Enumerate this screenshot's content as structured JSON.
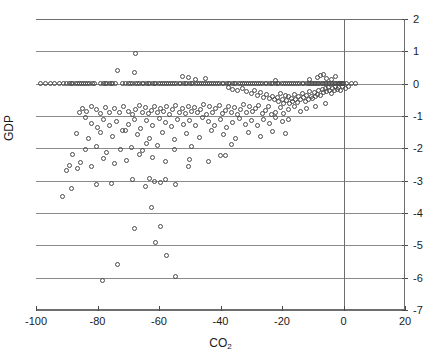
{
  "chart_data": {
    "type": "scatter",
    "title": "",
    "xlabel": "CO2",
    "xlabel_display": "CO",
    "xlabel_sub": "2",
    "ylabel": "GDP",
    "xlim": [
      -100,
      20
    ],
    "ylim": [
      -7,
      2
    ],
    "xticks": [
      -100,
      -80,
      -60,
      -40,
      -20,
      0,
      20
    ],
    "xtick_labels": [
      "-100",
      "-80",
      "-60",
      "-40",
      "-20",
      "0",
      "20"
    ],
    "yticks": [
      2,
      1,
      0,
      -1,
      -2,
      -3,
      -4,
      -5,
      -6,
      -7
    ],
    "ytick_labels": [
      "2",
      "1",
      "0",
      "-1",
      "-2",
      "-3",
      "-4",
      "-5",
      "-6",
      "-7"
    ],
    "ytick_side": "right",
    "grid": "horizontal",
    "grid_color": "#8a8a8a",
    "marker": "open-circle",
    "marker_color": "#4a4a4a",
    "reference_line_x": 0,
    "n_points": 420,
    "points": [
      [
        -98.5,
        0.0
      ],
      [
        -96.8,
        0.0
      ],
      [
        -95.2,
        0.0
      ],
      [
        -94.0,
        0.0
      ],
      [
        -92.5,
        0.0
      ],
      [
        -91.0,
        0.0
      ],
      [
        -90.0,
        0.0
      ],
      [
        -89.2,
        0.0
      ],
      [
        -88.5,
        0.0
      ],
      [
        -88.0,
        0.0
      ],
      [
        -87.3,
        0.0
      ],
      [
        -86.5,
        0.0
      ],
      [
        -86.0,
        0.0
      ],
      [
        -85.2,
        0.0
      ],
      [
        -84.5,
        0.0
      ],
      [
        -84.0,
        0.0
      ],
      [
        -83.2,
        0.0
      ],
      [
        -82.5,
        0.0
      ],
      [
        -81.8,
        0.0
      ],
      [
        -81.0,
        0.0
      ],
      [
        -79.0,
        0.0
      ],
      [
        -78.2,
        0.0
      ],
      [
        -77.5,
        0.0
      ],
      [
        -77.0,
        0.0
      ],
      [
        -76.2,
        0.0
      ],
      [
        -75.5,
        0.0
      ],
      [
        -75.0,
        0.0
      ],
      [
        -74.2,
        0.0
      ],
      [
        -72.0,
        0.0
      ],
      [
        -71.0,
        0.0
      ],
      [
        -70.0,
        0.0
      ],
      [
        -69.2,
        0.0
      ],
      [
        -68.5,
        0.0
      ],
      [
        -67.8,
        0.0
      ],
      [
        -67.0,
        0.0
      ],
      [
        -66.2,
        0.0
      ],
      [
        -65.5,
        0.0
      ],
      [
        -65.0,
        0.0
      ],
      [
        -64.2,
        0.0
      ],
      [
        -63.5,
        0.0
      ],
      [
        -63.0,
        0.0
      ],
      [
        -62.2,
        0.0
      ],
      [
        -61.5,
        0.0
      ],
      [
        -61.0,
        0.0
      ],
      [
        -60.2,
        0.0
      ],
      [
        -59.5,
        0.0
      ],
      [
        -59.0,
        0.0
      ],
      [
        -58.2,
        0.0
      ],
      [
        -57.5,
        0.0
      ],
      [
        -57.0,
        0.0
      ],
      [
        -56.2,
        0.0
      ],
      [
        -55.5,
        0.0
      ],
      [
        -55.0,
        0.0
      ],
      [
        -54.2,
        0.0
      ],
      [
        -53.5,
        0.0
      ],
      [
        -53.0,
        0.0
      ],
      [
        -52.2,
        0.0
      ],
      [
        -51.5,
        0.0
      ],
      [
        -51.0,
        0.0
      ],
      [
        -50.2,
        0.0
      ],
      [
        -49.5,
        0.0
      ],
      [
        -49.0,
        0.0
      ],
      [
        -48.2,
        0.0
      ],
      [
        -47.5,
        0.0
      ],
      [
        -47.0,
        0.0
      ],
      [
        -46.2,
        0.0
      ],
      [
        -45.5,
        0.0
      ],
      [
        -45.0,
        0.0
      ],
      [
        -44.2,
        0.0
      ],
      [
        -43.5,
        0.0
      ],
      [
        -43.0,
        0.0
      ],
      [
        -42.2,
        0.0
      ],
      [
        -41.5,
        0.0
      ],
      [
        -41.0,
        0.0
      ],
      [
        -40.2,
        0.0
      ],
      [
        -39.5,
        0.0
      ],
      [
        -39.0,
        0.0
      ],
      [
        -38.2,
        0.0
      ],
      [
        -37.5,
        0.0
      ],
      [
        -37.0,
        0.0
      ],
      [
        -36.2,
        0.0
      ],
      [
        -35.5,
        0.0
      ],
      [
        -35.0,
        0.0
      ],
      [
        -34.2,
        0.0
      ],
      [
        -33.5,
        0.0
      ],
      [
        -33.0,
        0.0
      ],
      [
        -32.2,
        0.0
      ],
      [
        -31.5,
        0.0
      ],
      [
        -31.0,
        0.0
      ],
      [
        -30.2,
        0.0
      ],
      [
        -29.5,
        0.0
      ],
      [
        -29.0,
        0.0
      ],
      [
        -28.2,
        0.0
      ],
      [
        -27.5,
        0.0
      ],
      [
        -27.0,
        0.0
      ],
      [
        -26.2,
        0.0
      ],
      [
        -25.5,
        0.0
      ],
      [
        -25.0,
        0.0
      ],
      [
        -24.2,
        0.0
      ],
      [
        -23.5,
        0.0
      ],
      [
        -23.0,
        0.0
      ],
      [
        -22.2,
        0.0
      ],
      [
        -21.5,
        0.0
      ],
      [
        -21.0,
        0.0
      ],
      [
        -20.2,
        0.0
      ],
      [
        -19.5,
        0.0
      ],
      [
        -19.0,
        0.0
      ],
      [
        -18.2,
        0.0
      ],
      [
        -17.5,
        0.0
      ],
      [
        -17.0,
        0.0
      ],
      [
        -16.2,
        0.0
      ],
      [
        -15.5,
        0.0
      ],
      [
        -15.0,
        0.0
      ],
      [
        -14.2,
        0.0
      ],
      [
        -13.5,
        0.0
      ],
      [
        -13.0,
        0.0
      ],
      [
        -12.2,
        0.0
      ],
      [
        -11.5,
        0.0
      ],
      [
        -11.0,
        0.0
      ],
      [
        -10.5,
        0.0
      ],
      [
        -10.0,
        0.0
      ],
      [
        -9.5,
        0.0
      ],
      [
        -9.0,
        0.0
      ],
      [
        -8.5,
        0.0
      ],
      [
        -8.0,
        0.0
      ],
      [
        -7.5,
        0.0
      ],
      [
        -7.0,
        0.0
      ],
      [
        -6.5,
        0.0
      ],
      [
        -6.0,
        0.0
      ],
      [
        -5.5,
        0.0
      ],
      [
        -5.0,
        0.0
      ],
      [
        -4.5,
        0.0
      ],
      [
        -4.0,
        0.0
      ],
      [
        -3.5,
        0.0
      ],
      [
        -3.0,
        0.0
      ],
      [
        -2.5,
        0.0
      ],
      [
        -2.0,
        0.0
      ],
      [
        -1.5,
        0.0
      ],
      [
        -1.2,
        0.0
      ],
      [
        -1.0,
        0.0
      ],
      [
        -0.8,
        0.0
      ],
      [
        -0.5,
        0.0
      ],
      [
        -0.3,
        0.0
      ],
      [
        0.0,
        0.0
      ],
      [
        1.0,
        0.0
      ],
      [
        2.5,
        0.0
      ],
      [
        4.0,
        0.0
      ],
      [
        -67.5,
        0.92
      ],
      [
        -73.5,
        0.42
      ],
      [
        -68.0,
        0.35
      ],
      [
        -52.5,
        0.22
      ],
      [
        -50.5,
        0.18
      ],
      [
        -48.0,
        0.12
      ],
      [
        -45.0,
        0.15
      ],
      [
        -22.0,
        0.1
      ],
      [
        -11.0,
        0.12
      ],
      [
        -8.5,
        0.18
      ],
      [
        -7.5,
        0.25
      ],
      [
        -6.5,
        0.3
      ],
      [
        -5.5,
        0.15
      ],
      [
        -4.0,
        0.12
      ],
      [
        -2.5,
        0.22
      ],
      [
        -37.5,
        -0.12
      ],
      [
        -36.0,
        -0.18
      ],
      [
        -34.5,
        -0.22
      ],
      [
        -33.0,
        -0.15
      ],
      [
        -31.5,
        -0.25
      ],
      [
        -30.0,
        -0.3
      ],
      [
        -29.0,
        -0.2
      ],
      [
        -28.0,
        -0.35
      ],
      [
        -27.0,
        -0.28
      ],
      [
        -26.0,
        -0.42
      ],
      [
        -25.0,
        -0.33
      ],
      [
        -24.0,
        -0.45
      ],
      [
        -23.0,
        -0.38
      ],
      [
        -22.5,
        -0.5
      ],
      [
        -21.5,
        -0.42
      ],
      [
        -21.0,
        -0.55
      ],
      [
        -20.5,
        -0.3
      ],
      [
        -20.0,
        -0.48
      ],
      [
        -19.5,
        -0.6
      ],
      [
        -19.0,
        -0.35
      ],
      [
        -18.5,
        -0.52
      ],
      [
        -18.0,
        -0.4
      ],
      [
        -17.5,
        -0.62
      ],
      [
        -17.0,
        -0.45
      ],
      [
        -16.5,
        -0.55
      ],
      [
        -16.0,
        -0.32
      ],
      [
        -15.5,
        -0.48
      ],
      [
        -15.0,
        -0.58
      ],
      [
        -14.5,
        -0.4
      ],
      [
        -14.0,
        -0.5
      ],
      [
        -13.5,
        -0.3
      ],
      [
        -13.0,
        -0.42
      ],
      [
        -12.5,
        -0.55
      ],
      [
        -12.0,
        -0.35
      ],
      [
        -11.5,
        -0.48
      ],
      [
        -11.0,
        -0.25
      ],
      [
        -10.5,
        -0.38
      ],
      [
        -10.0,
        -0.45
      ],
      [
        -9.5,
        -0.28
      ],
      [
        -9.0,
        -0.4
      ],
      [
        -8.5,
        -0.32
      ],
      [
        -8.0,
        -0.22
      ],
      [
        -7.5,
        -0.35
      ],
      [
        -7.0,
        -0.18
      ],
      [
        -6.5,
        -0.28
      ],
      [
        -6.0,
        -0.15
      ],
      [
        -5.5,
        -0.25
      ],
      [
        -5.0,
        -0.12
      ],
      [
        -4.5,
        -0.2
      ],
      [
        -4.0,
        -0.3
      ],
      [
        -3.5,
        -0.15
      ],
      [
        -3.0,
        -0.22
      ],
      [
        -2.5,
        -0.1
      ],
      [
        -2.0,
        -0.18
      ],
      [
        -1.5,
        -0.12
      ],
      [
        -1.0,
        -0.2
      ],
      [
        -0.5,
        -0.1
      ],
      [
        0.5,
        -0.15
      ],
      [
        1.5,
        -0.08
      ],
      [
        -6.0,
        -0.62
      ],
      [
        -9.0,
        -0.72
      ],
      [
        -12.0,
        -0.78
      ],
      [
        -14.0,
        -0.85
      ],
      [
        -16.0,
        -0.7
      ],
      [
        -18.0,
        -0.8
      ],
      [
        -19.5,
        -0.92
      ],
      [
        -20.5,
        -0.75
      ],
      [
        -22.0,
        -0.88
      ],
      [
        -23.5,
        -0.95
      ],
      [
        -24.5,
        -0.7
      ],
      [
        -25.5,
        -0.82
      ],
      [
        -26.5,
        -0.92
      ],
      [
        -27.5,
        -0.68
      ],
      [
        -28.5,
        -0.78
      ],
      [
        -29.5,
        -0.85
      ],
      [
        -30.5,
        -0.72
      ],
      [
        -31.5,
        -0.9
      ],
      [
        -32.5,
        -0.65
      ],
      [
        -33.5,
        -0.8
      ],
      [
        -34.5,
        -0.95
      ],
      [
        -35.5,
        -0.75
      ],
      [
        -36.5,
        -0.88
      ],
      [
        -37.5,
        -0.7
      ],
      [
        -38.5,
        -0.82
      ],
      [
        -39.5,
        -0.92
      ],
      [
        -40.5,
        -0.68
      ],
      [
        -41.5,
        -0.78
      ],
      [
        -42.5,
        -0.88
      ],
      [
        -43.5,
        -0.72
      ],
      [
        -44.5,
        -0.95
      ],
      [
        -45.5,
        -0.65
      ],
      [
        -46.5,
        -0.8
      ],
      [
        -47.5,
        -0.9
      ],
      [
        -48.5,
        -0.75
      ],
      [
        -49.5,
        -0.85
      ],
      [
        -50.5,
        -0.7
      ],
      [
        -51.5,
        -0.92
      ],
      [
        -52.5,
        -0.78
      ],
      [
        -53.5,
        -0.88
      ],
      [
        -54.5,
        -0.68
      ],
      [
        -55.5,
        -0.8
      ],
      [
        -56.5,
        -0.95
      ],
      [
        -57.5,
        -0.72
      ],
      [
        -58.5,
        -0.85
      ],
      [
        -59.5,
        -0.78
      ],
      [
        -60.5,
        -0.9
      ],
      [
        -61.5,
        -0.7
      ],
      [
        -62.5,
        -0.82
      ],
      [
        -63.5,
        -0.92
      ],
      [
        -64.5,
        -0.75
      ],
      [
        -65.5,
        -0.88
      ],
      [
        -66.5,
        -0.68
      ],
      [
        -67.5,
        -0.8
      ],
      [
        -68.5,
        -0.95
      ],
      [
        -70.0,
        -0.85
      ],
      [
        -71.5,
        -0.72
      ],
      [
        -73.0,
        -0.9
      ],
      [
        -74.5,
        -0.78
      ],
      [
        -76.0,
        -0.88
      ],
      [
        -77.5,
        -0.75
      ],
      [
        -79.0,
        -0.92
      ],
      [
        -80.5,
        -0.8
      ],
      [
        -82.0,
        -0.7
      ],
      [
        -83.5,
        -0.85
      ],
      [
        -85.0,
        -0.78
      ],
      [
        -86.0,
        -0.9
      ],
      [
        -18.0,
        -1.1
      ],
      [
        -20.0,
        -1.18
      ],
      [
        -22.0,
        -1.05
      ],
      [
        -24.0,
        -1.22
      ],
      [
        -26.0,
        -1.12
      ],
      [
        -28.0,
        -1.3
      ],
      [
        -30.0,
        -1.15
      ],
      [
        -32.0,
        -1.25
      ],
      [
        -34.0,
        -1.08
      ],
      [
        -36.0,
        -1.2
      ],
      [
        -38.0,
        -1.35
      ],
      [
        -40.0,
        -1.12
      ],
      [
        -42.0,
        -1.28
      ],
      [
        -44.0,
        -1.18
      ],
      [
        -46.0,
        -1.05
      ],
      [
        -48.0,
        -1.3
      ],
      [
        -50.0,
        -1.15
      ],
      [
        -52.0,
        -1.25
      ],
      [
        -54.0,
        -1.1
      ],
      [
        -56.0,
        -1.32
      ],
      [
        -58.0,
        -1.2
      ],
      [
        -60.0,
        -1.08
      ],
      [
        -62.0,
        -1.28
      ],
      [
        -64.0,
        -1.15
      ],
      [
        -66.0,
        -1.38
      ],
      [
        -68.0,
        -1.12
      ],
      [
        -70.0,
        -1.25
      ],
      [
        -72.0,
        -1.45
      ],
      [
        -74.0,
        -1.18
      ],
      [
        -76.0,
        -1.3
      ],
      [
        -78.0,
        -1.1
      ],
      [
        -80.0,
        -1.35
      ],
      [
        -82.0,
        -1.22
      ],
      [
        -84.0,
        -1.05
      ],
      [
        -19.0,
        -1.55
      ],
      [
        -23.0,
        -1.48
      ],
      [
        -27.0,
        -1.62
      ],
      [
        -31.0,
        -1.52
      ],
      [
        -35.0,
        -1.7
      ],
      [
        -39.0,
        -1.58
      ],
      [
        -43.0,
        -1.45
      ],
      [
        -47.0,
        -1.65
      ],
      [
        -51.0,
        -1.55
      ],
      [
        -55.0,
        -1.72
      ],
      [
        -59.0,
        -1.5
      ],
      [
        -63.0,
        -1.68
      ],
      [
        -67.0,
        -1.58
      ],
      [
        -71.0,
        -1.45
      ],
      [
        -75.0,
        -1.62
      ],
      [
        -79.0,
        -1.52
      ],
      [
        -83.0,
        -1.7
      ],
      [
        -87.0,
        -1.55
      ],
      [
        -36.5,
        -1.88
      ],
      [
        -49.5,
        -1.95
      ],
      [
        -55.0,
        -2.02
      ],
      [
        -60.5,
        -1.92
      ],
      [
        -64.0,
        -1.85
      ],
      [
        -65.5,
        -2.08
      ],
      [
        -69.0,
        -1.98
      ],
      [
        -72.5,
        -2.05
      ],
      [
        -77.0,
        -2.12
      ],
      [
        -80.5,
        -1.95
      ],
      [
        -84.0,
        -2.05
      ],
      [
        -88.0,
        -2.18
      ],
      [
        -38.5,
        -2.22
      ],
      [
        -50.0,
        -2.35
      ],
      [
        -50.5,
        -2.55
      ],
      [
        -58.0,
        -2.42
      ],
      [
        -62.0,
        -2.28
      ],
      [
        -66.5,
        -2.18
      ],
      [
        -70.5,
        -2.38
      ],
      [
        -74.5,
        -2.48
      ],
      [
        -78.0,
        -2.3
      ],
      [
        -82.0,
        -2.55
      ],
      [
        -85.5,
        -2.45
      ],
      [
        -86.5,
        -2.62
      ],
      [
        -89.0,
        -2.52
      ],
      [
        -90.0,
        -2.68
      ],
      [
        -40.0,
        -2.22
      ],
      [
        -44.0,
        -2.42
      ],
      [
        -54.5,
        -3.12
      ],
      [
        -58.0,
        -2.95
      ],
      [
        -59.5,
        -3.05
      ],
      [
        -61.5,
        -3.02
      ],
      [
        -63.0,
        -2.92
      ],
      [
        -64.5,
        -3.18
      ],
      [
        -68.5,
        -2.95
      ],
      [
        -75.5,
        -3.08
      ],
      [
        -80.5,
        -3.12
      ],
      [
        -88.5,
        -3.25
      ],
      [
        -91.5,
        -3.48
      ],
      [
        -62.5,
        -3.82
      ],
      [
        -59.5,
        -4.42
      ],
      [
        -68.0,
        -4.48
      ],
      [
        -61.0,
        -4.92
      ],
      [
        -57.5,
        -5.32
      ],
      [
        -73.5,
        -5.58
      ],
      [
        -54.5,
        -5.95
      ],
      [
        -78.5,
        -6.08
      ]
    ]
  }
}
